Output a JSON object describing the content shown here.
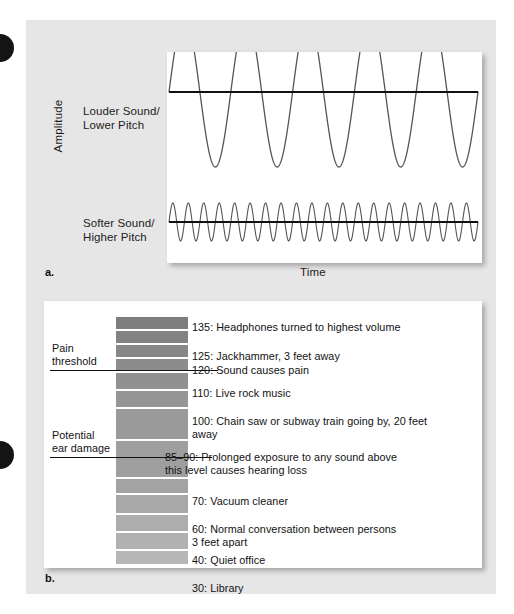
{
  "figure": {
    "background_color": "#e6e6e6",
    "panel_color": "#ffffff"
  },
  "panel_a": {
    "letter": "a.",
    "y_axis_label": "Amplitude",
    "x_axis_label": "Time",
    "wave_labels": [
      {
        "id": "loud-low",
        "text": "Louder Sound/\nLower Pitch"
      },
      {
        "id": "soft-high",
        "text": "Softer Sound/\nHigher Pitch"
      }
    ],
    "chart_data": {
      "type": "line",
      "title": "",
      "xlabel": "Time",
      "ylabel": "Amplitude",
      "grid": false,
      "legend": "none",
      "series": [
        {
          "name": "Louder Sound/Lower Pitch",
          "waveform": "sine",
          "cycles": 5,
          "amplitude_px": 75,
          "baseline_y_px": 40,
          "color": "#555555"
        },
        {
          "name": "Softer Sound/Higher Pitch",
          "waveform": "sine",
          "cycles": 20,
          "amplitude_px": 19,
          "baseline_y_px": 170,
          "color": "#555555"
        }
      ],
      "baselines": [
        {
          "name": "Louder Sound/Lower Pitch baseline",
          "y_px": 40,
          "color": "#111111"
        },
        {
          "name": "Softer Sound/Higher Pitch baseline",
          "y_px": 170,
          "color": "#111111"
        }
      ]
    }
  },
  "panel_b": {
    "letter": "b.",
    "side_labels": [
      {
        "id": "pain-threshold",
        "text": "Pain\nthreshold",
        "decibel": 120
      },
      {
        "id": "potential-ear-damage",
        "text": "Potential\near damage",
        "decibel": 87.5
      }
    ],
    "chart_data": {
      "type": "bar",
      "title": "",
      "xlabel": "",
      "ylabel": "Decibels (dB)",
      "grid": false,
      "legend": "none",
      "orientation": "vertical-scale",
      "bar_gradient": {
        "top_color": "#7e7e7e",
        "bottom_color": "#b4b4b4"
      },
      "threshold_lines": [
        {
          "label": "Pain threshold",
          "value": 120
        },
        {
          "label": "Potential ear damage",
          "value": 87.5
        }
      ],
      "categories": [
        135,
        125,
        120,
        110,
        100,
        87.5,
        70,
        60,
        40,
        30,
        15
      ],
      "values": [
        135,
        125,
        120,
        110,
        100,
        87.5,
        70,
        60,
        40,
        30,
        15
      ],
      "items": [
        {
          "level": "135",
          "text": "135: Headphones turned to highest volume"
        },
        {
          "level": "125",
          "text": "125: Jackhammer, 3 feet away"
        },
        {
          "level": "120",
          "text": "120: Sound causes pain"
        },
        {
          "level": "110",
          "text": "110: Live rock music"
        },
        {
          "level": "100",
          "text": "100: Chain saw or subway train going by, 20 feet\n        away"
        },
        {
          "level": "85–90",
          "text": "85–90: Prolonged exposure to any sound above\n            this level causes hearing loss"
        },
        {
          "level": "70",
          "text": "70: Vacuum cleaner"
        },
        {
          "level": "60",
          "text": "60: Normal conversation between persons\n      3 feet apart"
        },
        {
          "level": "40",
          "text": "40: Quiet office"
        },
        {
          "level": "30",
          "text": "30: Library"
        },
        {
          "level": "15",
          "text": "15: Normal breathing"
        }
      ]
    }
  }
}
